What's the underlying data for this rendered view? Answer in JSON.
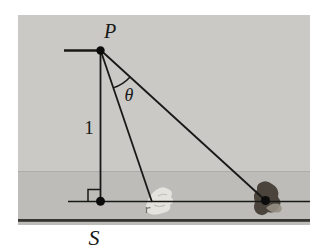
{
  "figure": {
    "labels": {
      "apex_point": "P",
      "base_point": "S",
      "angle": "θ",
      "vertical_side": "1"
    },
    "colors": {
      "background": "#ffffff",
      "sky": "#cac9c6",
      "shore_band": "#bdbcb8",
      "shore_divider": "#aeada9",
      "ink": "#181816",
      "bottom_rule": "#35342f",
      "near_figure": "#e9e8e2",
      "near_figure_mark": "#76736c",
      "far_figure": "#4a443d",
      "far_figure_highlight": "#968f83",
      "dot": "#0c0c0c"
    }
  }
}
